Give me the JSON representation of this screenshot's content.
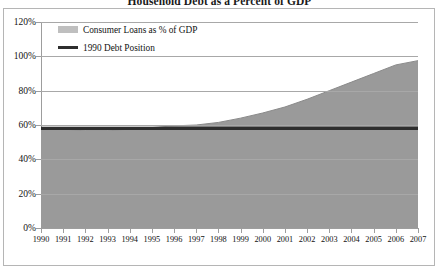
{
  "chart_data": {
    "type": "area",
    "title": "Household Debt as a Percent of GDP",
    "xlabel": "",
    "ylabel": "",
    "ylim": [
      0,
      120
    ],
    "ytick_labels": [
      "0%",
      "20%",
      "40%",
      "60%",
      "80%",
      "100%",
      "120%"
    ],
    "ytick_values": [
      0,
      20,
      40,
      60,
      80,
      100,
      120
    ],
    "grid": true,
    "grid_axis": "y",
    "legend_position": "top-left-inside",
    "categories": [
      "1990",
      "1991",
      "1992",
      "1993",
      "1994",
      "1995",
      "1996",
      "1997",
      "1998",
      "1999",
      "2000",
      "2001",
      "2002",
      "2003",
      "2004",
      "2005",
      "2006",
      "2007"
    ],
    "series": [
      {
        "name": "Consumer Loans as % of GDP",
        "type": "area",
        "color": "#9a9a9a",
        "values": [
          58,
          57.5,
          57,
          57,
          57.5,
          58.5,
          59.5,
          60,
          61.5,
          64,
          67,
          70.5,
          75,
          80,
          85,
          90,
          95,
          97.5
        ]
      },
      {
        "name": "1990 Debt Position",
        "type": "line",
        "color": "#2e2e2e",
        "values": [
          58,
          58,
          58,
          58,
          58,
          58,
          58,
          58,
          58,
          58,
          58,
          58,
          58,
          58,
          58,
          58,
          58,
          58
        ]
      }
    ],
    "legend": [
      {
        "label": "Consumer Loans as % of GDP",
        "marker": "area-swatch",
        "color": "#bfbfbf"
      },
      {
        "label": "1990 Debt Position",
        "marker": "line-swatch",
        "color": "#2e2e2e"
      }
    ],
    "colors": {
      "area_fill": "#9a9a9a",
      "reference_line": "#2e2e2e",
      "gridline": "#a8a8a8",
      "axis": "#9d9d9d",
      "border": "#b5b5b5",
      "background": "#ffffff",
      "text": "#111111"
    }
  }
}
